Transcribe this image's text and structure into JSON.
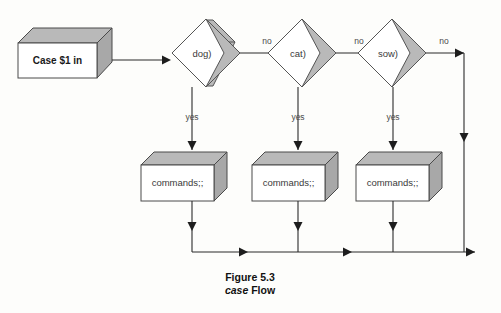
{
  "figure": {
    "caption_number": "Figure 5.3",
    "caption_title_italic": "case",
    "caption_title_rest": " Flow"
  },
  "nodes": {
    "start": {
      "name": "case-statement-box",
      "text": "Case  $1  in"
    },
    "decisions": [
      {
        "name": "decision-dog",
        "text": "dog)"
      },
      {
        "name": "decision-cat",
        "text": "cat)"
      },
      {
        "name": "decision-sow",
        "text": "sow)"
      }
    ],
    "actions": [
      {
        "name": "commands-box-1",
        "text": "commands;;"
      },
      {
        "name": "commands-box-2",
        "text": "commands;;"
      },
      {
        "name": "commands-box-3",
        "text": "commands;;"
      }
    ]
  },
  "edges": {
    "no_labels": [
      "no",
      "no",
      "no"
    ],
    "yes_labels": [
      "yes",
      "yes",
      "yes"
    ]
  },
  "colors": {
    "shade": "#b9b9b9",
    "line": "#2b2b2b",
    "text": "#3a3a3a",
    "background": "#fdfdfb"
  }
}
